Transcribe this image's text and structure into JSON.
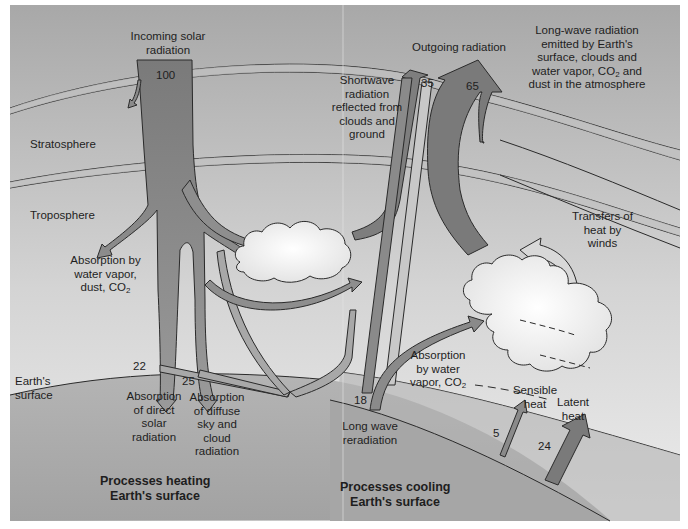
{
  "diagram": {
    "colors": {
      "sky_top": "#a9a9a9",
      "sky_bottom": "#e8e8e8",
      "layer_band": "#b5b5b5",
      "ground": "#a0a0a0",
      "arrow_fill": "#8a8a8a",
      "arrow_light": "#c4c4c4",
      "cloud": "#f6f6f6",
      "outline": "#2a2a2a"
    },
    "layers": {
      "stratosphere": "Stratosphere",
      "troposphere": "Troposphere",
      "surface": "Earth's surface"
    },
    "incoming": {
      "label": "Incoming solar radiation",
      "value": "100"
    },
    "outgoing": {
      "label": "Outgoing radiation",
      "shortwave_value": "35",
      "longwave_value": "65"
    },
    "shortwave_reflected": {
      "label": "Shortwave radiation reflected from clouds and ground"
    },
    "longwave_emitted": {
      "label_line1": "Long-wave radiation",
      "label_line2": "emitted by Earth's",
      "label_line3": "surface, clouds and",
      "label_line4a": "water vapor, CO",
      "label_line4sub": "2",
      "label_line4b": " and",
      "label_line5": "dust in the atmosphere"
    },
    "absorption_atmosphere": {
      "line1": "Absorption by",
      "line2": "water vapor,",
      "line3a": "dust, CO",
      "line3sub": "2"
    },
    "direct": {
      "value": "22",
      "line1": "Absorption",
      "line2": "of direct",
      "line3": "solar",
      "line4": "radiation"
    },
    "diffuse": {
      "value": "25",
      "line1": "Absorption",
      "line2": "of diffuse",
      "line3": "sky and",
      "line4": "cloud",
      "line5": "radiation"
    },
    "longwave_reradiation": {
      "value": "18",
      "line1": "Long wave",
      "line2": "reradiation"
    },
    "absorption_vapor": {
      "line1": "Absorption",
      "line2": "by water",
      "line3a": "vapor, CO",
      "line3sub": "2"
    },
    "transfers": {
      "line1": "Transfers of",
      "line2": "heat by",
      "line3": "winds"
    },
    "sensible": {
      "value": "5",
      "line1": "Sensible",
      "line2": "heat"
    },
    "latent": {
      "value": "24",
      "line1": "Latent",
      "line2": "heat"
    },
    "heating_caption": {
      "line1": "Processes heating",
      "line2": "Earth's surface"
    },
    "cooling_caption": {
      "line1": "Processes cooling",
      "line2": "Earth's surface"
    }
  }
}
